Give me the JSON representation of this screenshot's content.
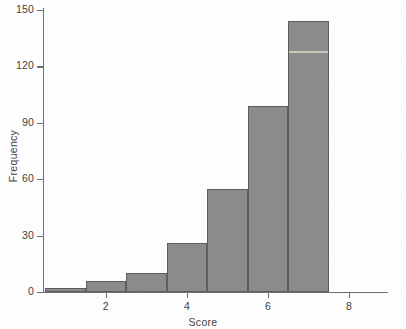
{
  "chart_data": {
    "type": "bar",
    "title": "",
    "subtitle": "",
    "xlabel": "Score",
    "ylabel": "Frequency",
    "xlim": [
      0.5,
      8.5
    ],
    "ylim": [
      0,
      150
    ],
    "grid": false,
    "legend": null,
    "bin_width": 1,
    "bin_edges": [
      0.5,
      1.5,
      2.5,
      3.5,
      4.5,
      5.5,
      6.5,
      7.5
    ],
    "categories": [
      "0.5-1.5",
      "1.5-2.5",
      "2.5-3.5",
      "3.5-4.5",
      "4.5-5.5",
      "5.5-6.5",
      "6.5-7.5"
    ],
    "values": [
      2,
      6,
      10,
      26,
      55,
      99,
      144
    ],
    "bars": [
      {
        "bin_start": 0.5,
        "bin_end": 1.5,
        "value": 2
      },
      {
        "bin_start": 1.5,
        "bin_end": 2.5,
        "value": 6
      },
      {
        "bin_start": 2.5,
        "bin_end": 3.5,
        "value": 10
      },
      {
        "bin_start": 3.5,
        "bin_end": 4.5,
        "value": 26
      },
      {
        "bin_start": 4.5,
        "bin_end": 5.5,
        "value": 55
      },
      {
        "bin_start": 5.5,
        "bin_end": 6.5,
        "value": 99
      },
      {
        "bin_start": 6.5,
        "bin_end": 7.5,
        "value": 144
      }
    ],
    "yticks": [
      0,
      30,
      60,
      90,
      120,
      150
    ],
    "ytick_labels": [
      "0",
      "30",
      "60",
      "90",
      "120",
      "150"
    ],
    "xticks": [
      2,
      4,
      6,
      8
    ],
    "xtick_labels": [
      "2",
      "4",
      "6",
      "8"
    ],
    "colors": {
      "bar_fill": "#8b8b8b",
      "bar_edge": "#5d5d5d",
      "axis": "#6f6f6f",
      "text": "#3f3f3f",
      "background": "#fdfdfd"
    }
  }
}
